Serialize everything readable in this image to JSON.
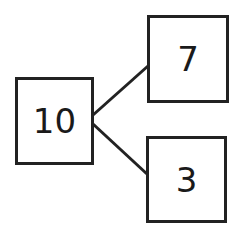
{
  "diagram": {
    "type": "number-bond",
    "whole": {
      "value": "10"
    },
    "parts": [
      {
        "value": "7"
      },
      {
        "value": "3"
      }
    ],
    "colors": {
      "stroke": "#222222",
      "background": "#ffffff",
      "text": "#1a1a1a"
    }
  }
}
